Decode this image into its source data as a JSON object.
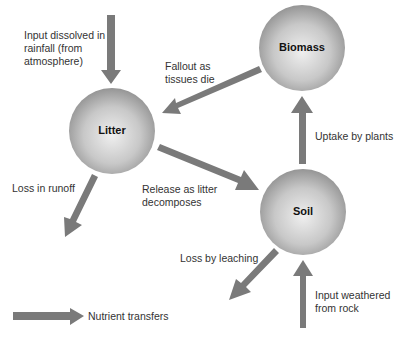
{
  "diagram": {
    "type": "nutrient cycle",
    "colors": {
      "arrow": "#7a7a7a",
      "node_light": "#e8e8e8",
      "node_dark": "#9a9a9a",
      "text": "#333333"
    },
    "nodes": [
      {
        "id": "litter",
        "label": "Litter"
      },
      {
        "id": "biomass",
        "label": "Biomass"
      },
      {
        "id": "soil",
        "label": "Soil"
      }
    ],
    "flows": [
      {
        "id": "rainfall-input",
        "label": "Input dissolved in\nrainfall (from\natmosphere)",
        "from": "atmosphere",
        "to": "litter"
      },
      {
        "id": "fallout",
        "label": "Fallout as\ntissues die",
        "from": "biomass",
        "to": "litter"
      },
      {
        "id": "uptake",
        "label": "Uptake by plants",
        "from": "soil",
        "to": "biomass"
      },
      {
        "id": "runoff-loss",
        "label": "Loss in runoff",
        "from": "litter",
        "to": "outside"
      },
      {
        "id": "release",
        "label": "Release as litter\ndecomposes",
        "from": "litter",
        "to": "soil"
      },
      {
        "id": "leaching-loss",
        "label": "Loss by leaching",
        "from": "soil",
        "to": "outside"
      },
      {
        "id": "weathering-input",
        "label": "Input weathered\nfrom rock",
        "from": "rock",
        "to": "soil"
      }
    ],
    "legend": {
      "label": "Nutrient transfers"
    }
  }
}
